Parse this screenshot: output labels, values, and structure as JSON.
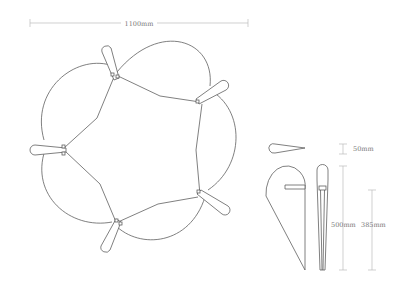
{
  "diagram": {
    "dimensions": {
      "overall_width": "1100mm",
      "leaf_width": "50mm",
      "leaf_height": "500mm",
      "slot_height": "385mm"
    },
    "views": [
      "top-view-assembly",
      "leaf-top-view",
      "leaf-side-view",
      "leaf-front-view"
    ],
    "leaf_count": 5,
    "colors": {
      "line": "#555555",
      "dimension": "#bbbbbb",
      "label": "#777777",
      "background": "#ffffff"
    }
  }
}
